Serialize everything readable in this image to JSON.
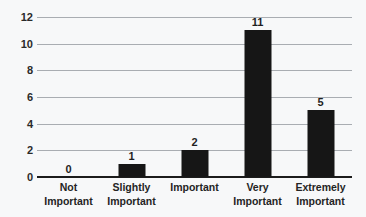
{
  "chart_data": {
    "type": "bar",
    "title": "",
    "subtitle": "",
    "xlabel": "",
    "ylabel": "",
    "categories": [
      "Not Important",
      "Slightly Important",
      "Important",
      "Very Important",
      "Extremely Important"
    ],
    "category_lines": [
      [
        "Not",
        "Important"
      ],
      [
        "Slightly",
        "Important"
      ],
      [
        "Important",
        ""
      ],
      [
        "Very",
        "Important"
      ],
      [
        "Extremely",
        "Important"
      ]
    ],
    "values": [
      0,
      1,
      2,
      11,
      5
    ],
    "data_labels": [
      "0",
      "1",
      "2",
      "11",
      "5"
    ],
    "ylim": [
      0,
      12
    ],
    "ytick_step": 2,
    "yticks": [
      0,
      2,
      4,
      6,
      8,
      10,
      12
    ],
    "ytick_labels": [
      "0",
      "2",
      "4",
      "6",
      "8",
      "10",
      "12"
    ],
    "grid": true,
    "grid_axis": "y",
    "legend": false,
    "legend_position": "none",
    "orientation": "vertical",
    "bar_color": "#161616",
    "gridline_color": "#a9adb2",
    "axis_color": "#1c1c1c",
    "background_color": "#f7f8f9",
    "text_color": "#242424"
  }
}
